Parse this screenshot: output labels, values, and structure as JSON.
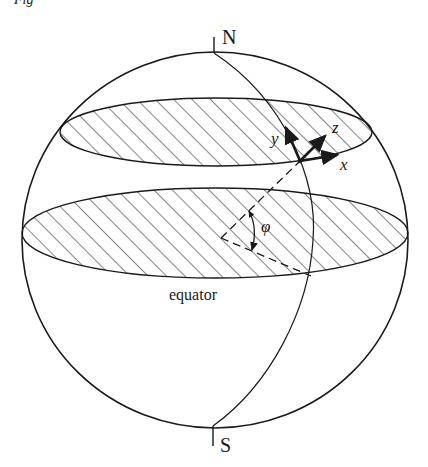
{
  "figure": {
    "caption_fragment": "Fig",
    "labels": {
      "north": "N",
      "south": "S",
      "equator": "equator",
      "axis_x": "x",
      "axis_y": "y",
      "axis_z": "z",
      "angle": "φ"
    },
    "colors": {
      "stroke": "#1a1a1a",
      "hatch": "#333333",
      "background": "#ffffff"
    },
    "elements": [
      "sphere-outline",
      "latitude-circle-hatched",
      "equator-plane-hatched",
      "meridian",
      "local-axes-xyz",
      "latitude-angle-phi"
    ]
  }
}
